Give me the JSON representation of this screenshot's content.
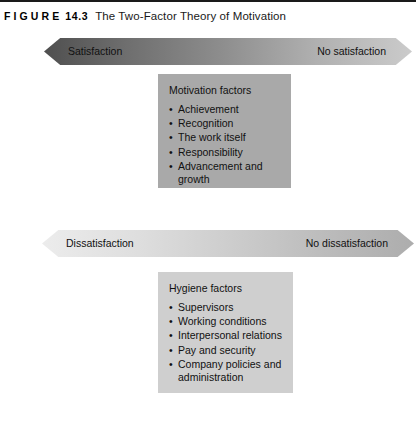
{
  "figure": {
    "label_word": "FIGURE",
    "number": "14.3",
    "title": "The Two-Factor Theory of Motivation"
  },
  "colors": {
    "page_background": "#ffffff",
    "rule": "#1a1a1a",
    "arrow_satisfaction_start": "#4f4f4f",
    "arrow_satisfaction_end": "#cbcbcb",
    "arrow_dissatisfaction_start": "#ececec",
    "arrow_dissatisfaction_end": "#adadad",
    "box_motivation": "#a9a9a9",
    "box_hygiene": "#cfcfcf",
    "text": "#111111"
  },
  "satisfaction_arrow": {
    "left_label": "Satisfaction",
    "right_label": "No satisfaction"
  },
  "dissatisfaction_arrow": {
    "left_label": "Dissatisfaction",
    "right_label": "No dissatisfaction"
  },
  "motivation_box": {
    "heading": "Motivation factors",
    "items": [
      "Achievement",
      "Recognition",
      "The work itself",
      "Responsibility",
      "Advancement and growth"
    ]
  },
  "hygiene_box": {
    "heading": "Hygiene factors",
    "items": [
      "Supervisors",
      "Working conditions",
      "Interpersonal relations",
      "Pay and security",
      "Company policies and administration"
    ]
  }
}
